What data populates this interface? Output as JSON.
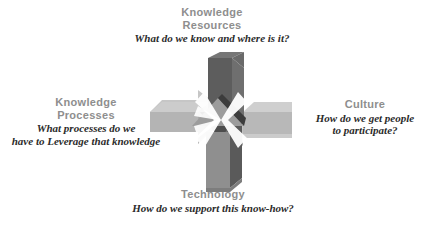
{
  "diagram": {
    "title_hidden": "",
    "background_color": "#ffffff",
    "heading_color": "#8e8e8e",
    "question_color": "#2b2b2b",
    "center_graphic": {
      "name": "four-converging-arrows",
      "arrow_count": 4,
      "directions": [
        "down",
        "right",
        "left",
        "up"
      ],
      "colors": {
        "arrow_dark_face": "#5d5d5d",
        "arrow_dark_side": "#464646",
        "arrow_dark_top": "#6e6e6e",
        "arrow_light_face": "#b4b4b4",
        "arrow_light_side": "#9a9a9a",
        "arrow_light_top": "#c6c6c6",
        "arrow_mid_face": "#8f8f8f",
        "arrow_mid_side": "#6a6a6a",
        "center_gap": "#ffffff"
      }
    },
    "quadrants": [
      {
        "id": "knowledge-resources",
        "position": "top",
        "heading": "Knowledge\nResources",
        "question": "What do we know and where is it?"
      },
      {
        "id": "knowledge-processes",
        "position": "left",
        "heading": "Knowledge\nProcesses",
        "question": "What processes do we\nhave to Leverage that knowledge"
      },
      {
        "id": "culture",
        "position": "right",
        "heading": "Culture",
        "question": "How do we get people\nto participate?"
      },
      {
        "id": "technology",
        "position": "bottom",
        "heading": "Technology",
        "question": "How do we support this know-how?"
      }
    ]
  }
}
